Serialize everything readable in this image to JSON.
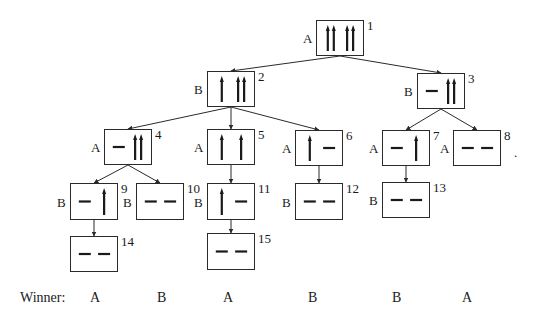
{
  "diagram": {
    "title": "",
    "nodes": [
      {
        "id": "1",
        "label": "1",
        "player": "A",
        "x": 316,
        "y": 20,
        "w": 48,
        "h": 36,
        "heaps": [
          "||",
          "||"
        ]
      },
      {
        "id": "2",
        "label": "2",
        "player": "B",
        "x": 207,
        "y": 71,
        "w": 48,
        "h": 36,
        "heaps": [
          "|",
          "||"
        ]
      },
      {
        "id": "3",
        "label": "3",
        "player": "B",
        "x": 417,
        "y": 73,
        "w": 48,
        "h": 36,
        "heaps": [
          "-",
          "||"
        ]
      },
      {
        "id": "4",
        "label": "4",
        "player": "A",
        "x": 104,
        "y": 129,
        "w": 48,
        "h": 36,
        "heaps": [
          "-",
          "||"
        ]
      },
      {
        "id": "5",
        "label": "5",
        "player": "A",
        "x": 207,
        "y": 129,
        "w": 48,
        "h": 36,
        "heaps": [
          "|",
          "|"
        ]
      },
      {
        "id": "6",
        "label": "6",
        "player": "A",
        "x": 295,
        "y": 130,
        "w": 48,
        "h": 36,
        "heaps": [
          "|",
          "-"
        ]
      },
      {
        "id": "7",
        "label": "7",
        "player": "A",
        "x": 382,
        "y": 130,
        "w": 48,
        "h": 36,
        "heaps": [
          "-",
          "|"
        ]
      },
      {
        "id": "8",
        "label": "8",
        "player": "A",
        "x": 453,
        "y": 130,
        "w": 48,
        "h": 36,
        "heaps": [
          "-",
          "-"
        ]
      },
      {
        "id": "9",
        "label": "9",
        "player": "B",
        "x": 70,
        "y": 183,
        "w": 48,
        "h": 37,
        "heaps": [
          "-",
          "|"
        ]
      },
      {
        "id": "10",
        "label": "10",
        "player": "B",
        "x": 136,
        "y": 183,
        "w": 48,
        "h": 37,
        "heaps": [
          "-",
          "-"
        ]
      },
      {
        "id": "11",
        "label": "11",
        "player": "B",
        "x": 207,
        "y": 183,
        "w": 48,
        "h": 37,
        "heaps": [
          "|",
          "-"
        ]
      },
      {
        "id": "12",
        "label": "12",
        "player": "B",
        "x": 295,
        "y": 183,
        "w": 48,
        "h": 37,
        "heaps": [
          "-",
          "-"
        ]
      },
      {
        "id": "13",
        "label": "13",
        "player": "B",
        "x": 382,
        "y": 182,
        "w": 48,
        "h": 36,
        "heaps": [
          "-",
          "-"
        ]
      },
      {
        "id": "14",
        "label": "14",
        "player": "",
        "x": 70,
        "y": 236,
        "w": 48,
        "h": 36,
        "heaps": [
          "-",
          "-"
        ]
      },
      {
        "id": "15",
        "label": "15",
        "player": "",
        "x": 207,
        "y": 233,
        "w": 48,
        "h": 37,
        "heaps": [
          "-",
          "-"
        ]
      }
    ],
    "edges": [
      [
        "1",
        "2"
      ],
      [
        "1",
        "3"
      ],
      [
        "2",
        "4"
      ],
      [
        "2",
        "5"
      ],
      [
        "2",
        "6"
      ],
      [
        "3",
        "7"
      ],
      [
        "3",
        "8"
      ],
      [
        "4",
        "9"
      ],
      [
        "4",
        "10"
      ],
      [
        "5",
        "11"
      ],
      [
        "6",
        "12"
      ],
      [
        "7",
        "13"
      ],
      [
        "9",
        "14"
      ],
      [
        "11",
        "15"
      ]
    ],
    "winner": {
      "label": "Winner:",
      "values": [
        {
          "text": "A",
          "x": 90
        },
        {
          "text": "B",
          "x": 157
        },
        {
          "text": "A",
          "x": 223
        },
        {
          "text": "B",
          "x": 308
        },
        {
          "text": "B",
          "x": 392
        },
        {
          "text": "A",
          "x": 462
        }
      ]
    },
    "trailing_mark": "."
  },
  "colors": {
    "line": "#2a2a2a",
    "stick": "#1a1a1a",
    "background": "#ffffff"
  }
}
